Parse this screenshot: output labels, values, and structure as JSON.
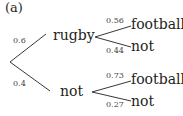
{
  "part_label": "(a)",
  "tree": {
    "first_stage": [
      {
        "outcome": "rugby",
        "probability": "0.6",
        "second_stage": [
          {
            "outcome": "football",
            "probability": "0.56"
          },
          {
            "outcome": "not",
            "probability": "0.44"
          }
        ]
      },
      {
        "outcome": "not",
        "probability": "0.4",
        "second_stage": [
          {
            "outcome": "football",
            "probability": "0.73"
          },
          {
            "outcome": "not",
            "probability": "0.27"
          }
        ]
      }
    ]
  },
  "colors": {
    "line": "#231f20",
    "text": "#231f20"
  }
}
